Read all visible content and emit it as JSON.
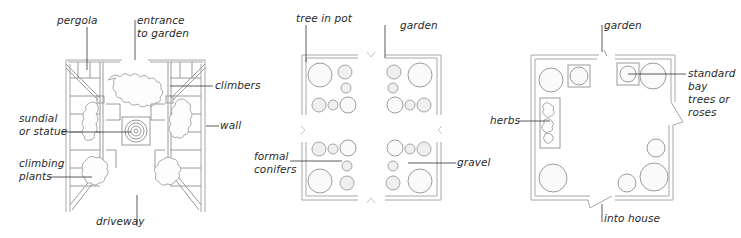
{
  "figure": {
    "panels": [
      {
        "id": "driveway-plan",
        "labels": {
          "pergola": "pergola",
          "entrance": "entrance\nto garden",
          "climbers": "climbers",
          "sundial": "sundial\nor statue",
          "wall": "wall",
          "climbing_plants": "climbing\nplants",
          "driveway": "driveway"
        }
      },
      {
        "id": "formal-pots-plan",
        "labels": {
          "tree_in_pot": "tree in pot",
          "garden": "garden",
          "formal_conifers": "formal\nconifers",
          "gravel": "gravel"
        }
      },
      {
        "id": "house-courtyard-plan",
        "labels": {
          "garden": "garden",
          "standard": "standard\nbay\ntrees or\nroses",
          "herbs": "herbs",
          "into_house": "into house"
        }
      }
    ],
    "colors": {
      "line": "#9a9a9a",
      "leader": "#333333",
      "text": "#2a2a2a"
    }
  }
}
